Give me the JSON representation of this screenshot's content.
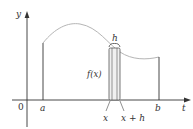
{
  "diagram": {
    "type": "area-under-curve",
    "colors": {
      "axis": "#333333",
      "curve": "#b5b5b5",
      "rect_fill": "#f0f0f0",
      "rect_stroke": "#555555",
      "text": "#333333"
    },
    "labels": {
      "y_axis": "y",
      "t_axis": "t",
      "origin": "0",
      "a": "a",
      "b": "b",
      "x": "x",
      "x_plus_h": "x + h",
      "h": "h",
      "fx": "f(x)"
    }
  }
}
